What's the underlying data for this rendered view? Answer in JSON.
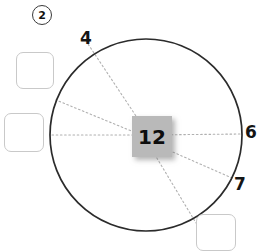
{
  "question": {
    "number": "2"
  },
  "diagram": {
    "type": "circle-with-radii",
    "center_label": "12",
    "circle": {
      "cx": 146,
      "cy": 135,
      "r": 96,
      "stroke": "#2b2b2b"
    },
    "spokes": [
      {
        "name": "spoke-to-4",
        "angle_deg": 228,
        "label": "4",
        "labeled": true
      },
      {
        "name": "spoke-to-box-a",
        "angle_deg": 200,
        "label": "",
        "labeled": false
      },
      {
        "name": "spoke-to-box-b",
        "angle_deg": 180,
        "label": "",
        "labeled": false
      },
      {
        "name": "spoke-to-6",
        "angle_deg": 0,
        "label": "6",
        "labeled": true
      },
      {
        "name": "spoke-to-7",
        "angle_deg": 27,
        "label": "7",
        "labeled": true
      },
      {
        "name": "spoke-to-box-c",
        "angle_deg": 70,
        "label": "",
        "labeled": false
      }
    ],
    "edge_labels": [
      {
        "name": "label-4",
        "text": "4"
      },
      {
        "name": "label-6",
        "text": "6"
      },
      {
        "name": "label-7",
        "text": "7"
      }
    ],
    "answer_boxes": [
      {
        "name": "answer-box-upper-left",
        "value": ""
      },
      {
        "name": "answer-box-left",
        "value": ""
      },
      {
        "name": "answer-box-bottom-right",
        "value": ""
      }
    ]
  },
  "colors": {
    "circle_stroke": "#2b2b2b",
    "spoke_stroke": "#b0b0b0",
    "chip_background": "#b9b9b9",
    "box_border": "#c9c9c9",
    "text": "#151515"
  }
}
